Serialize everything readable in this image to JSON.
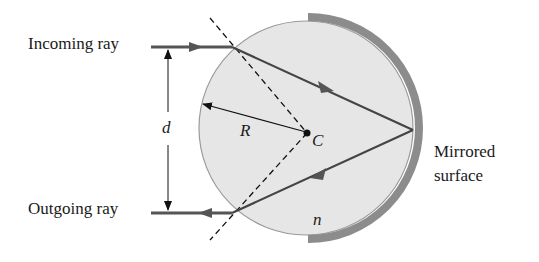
{
  "diagram": {
    "labels": {
      "incoming": "Incoming ray",
      "outgoing": "Outgoing ray",
      "distance": "d",
      "radius": "R",
      "center": "C",
      "index": "n",
      "mirror_line1": "Mirrored",
      "mirror_line2": "surface"
    },
    "colors": {
      "sphere_fill": "#e6e6e6",
      "sphere_edge": "#9a9a9a",
      "mirror": "#8c8c8c",
      "ray": "#555555",
      "line": "#222222"
    }
  }
}
